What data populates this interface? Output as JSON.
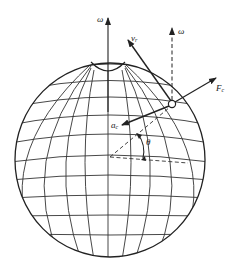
{
  "figure": {
    "colors": {
      "line": "#2a2a2a",
      "background": "#ffffff"
    }
  },
  "labels": {
    "omega_axis": "ω",
    "omega_parallel": "ω",
    "relative_velocity": "v",
    "relative_velocity_sub": "r",
    "coriolis_force": "F",
    "coriolis_force_sub": "c",
    "coriolis_accel": "a",
    "coriolis_accel_sub": "c",
    "latitude_angle": "θ"
  },
  "icons": {
    "particle": "small-circle",
    "arrows": "filled-arrowhead"
  }
}
